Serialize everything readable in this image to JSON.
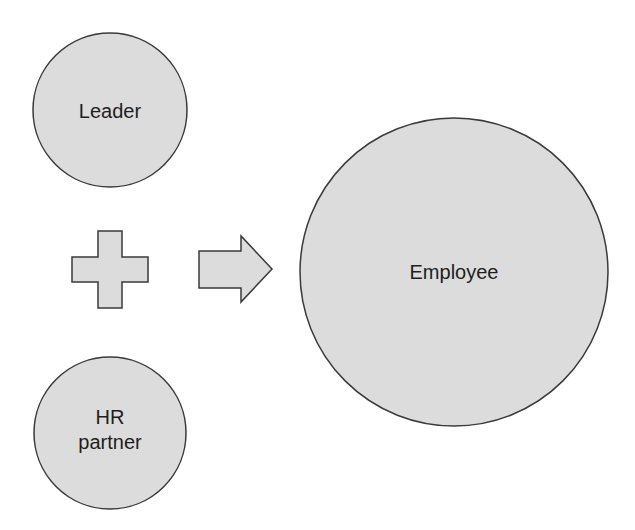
{
  "diagram": {
    "nodes": [
      {
        "id": "leader",
        "label": "Leader"
      },
      {
        "id": "hr",
        "label_line1": "HR",
        "label_line2": "partner"
      },
      {
        "id": "employee",
        "label": "Employee"
      }
    ],
    "operators": [
      {
        "type": "plus-icon"
      },
      {
        "type": "arrow-right-icon"
      }
    ],
    "colors": {
      "fill": "#dcdcdc",
      "stroke": "#3a3a3a",
      "text": "#1e1e1e"
    }
  }
}
